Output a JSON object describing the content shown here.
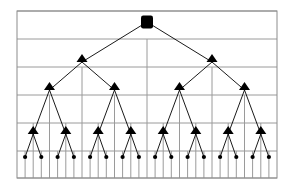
{
  "figure": {
    "name": "binary-tree-recursive-partition-diagram",
    "type": "diagram",
    "background_color": "#ffffff",
    "border_color": "#8c8c8c",
    "gridline_color": "#9a9a9a",
    "edge_color": "#000000",
    "node_color": "#000000",
    "canvas": {
      "width": 292,
      "height": 190
    }
  },
  "plot_area": {
    "x": 17,
    "y": 11,
    "width": 260,
    "height": 167
  },
  "grid": {
    "horizontal_lines_y": [
      11,
      39,
      67,
      95,
      123,
      151,
      178
    ],
    "vertical_levels": [
      {
        "level": 1,
        "y_top": 39,
        "y_bottom": 178,
        "x_positions": [
          147
        ]
      },
      {
        "level": 2,
        "y_top": 67,
        "y_bottom": 178,
        "x_positions": [
          82,
          212
        ]
      },
      {
        "level": 3,
        "y_top": 95,
        "y_bottom": 178,
        "x_positions": [
          49.5,
          114.5,
          179.5,
          244.5
        ]
      },
      {
        "level": 4,
        "y_top": 123,
        "y_bottom": 178,
        "x_positions": [
          33.2,
          65.8,
          98.2,
          130.8,
          163.2,
          195.8,
          228.2,
          260.8
        ]
      },
      {
        "level": 5,
        "y_top": 151,
        "y_bottom": 178,
        "x_positions": [
          25.1,
          41.3,
          57.6,
          73.9,
          90.1,
          106.3,
          122.6,
          138.9,
          155.1,
          171.3,
          187.6,
          203.9,
          220.1,
          236.3,
          252.6,
          268.9
        ]
      }
    ]
  },
  "tree": {
    "depth": 4,
    "leaf_count": 16,
    "root": {
      "label": "root-node",
      "shape": "rounded-blob",
      "x": 147,
      "y": 22,
      "rx": 6,
      "ry": 6.5
    },
    "internal_node_shape": "triangle",
    "leaf_node_shape": "dot",
    "levels": [
      {
        "level": 0,
        "y": 22,
        "node_count": 1,
        "x_positions": [
          147
        ]
      },
      {
        "level": 1,
        "y": 62,
        "node_count": 2,
        "x_positions": [
          82,
          212
        ]
      },
      {
        "level": 2,
        "y": 90,
        "node_count": 4,
        "x_positions": [
          49.5,
          114.5,
          179.5,
          244.5
        ]
      },
      {
        "level": 3,
        "y": 134,
        "node_count": 8,
        "x_positions": [
          33.2,
          65.8,
          98.2,
          130.8,
          163.2,
          195.8,
          228.2,
          260.8
        ]
      },
      {
        "level": 4,
        "y": 157,
        "node_count": 16,
        "x_positions": [
          25.1,
          41.3,
          57.6,
          73.9,
          90.1,
          106.3,
          122.6,
          138.9,
          155.1,
          171.3,
          187.6,
          203.9,
          220.1,
          236.3,
          252.6,
          268.9
        ]
      }
    ],
    "triangle": {
      "half_width": 5.5,
      "height": 8
    },
    "leaf_dot_radius": 2.1
  }
}
